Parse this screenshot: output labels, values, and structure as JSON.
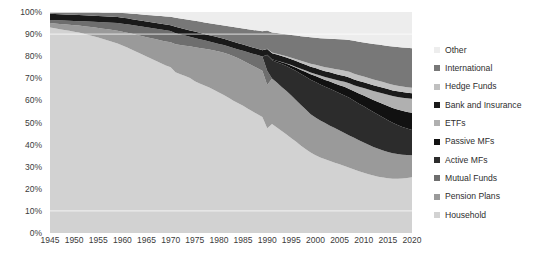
{
  "chart_data": {
    "type": "area",
    "title": "",
    "subtitle": "",
    "xlabel": "",
    "ylabel": "",
    "stacked": true,
    "normalized": true,
    "grid": true,
    "gridlines_visible_at": [
      90,
      10
    ],
    "legend_position": "right",
    "xlim": [
      1945,
      2020
    ],
    "ylim": [
      0,
      100
    ],
    "y_ticks": [
      "0%",
      "10%",
      "20%",
      "30%",
      "40%",
      "50%",
      "60%",
      "70%",
      "80%",
      "90%",
      "100%"
    ],
    "y_tick_values": [
      0,
      10,
      20,
      30,
      40,
      50,
      60,
      70,
      80,
      90,
      100
    ],
    "x_ticks": [
      "1945",
      "1950",
      "1955",
      "1960",
      "1965",
      "1970",
      "1975",
      "1980",
      "1985",
      "1990",
      "1995",
      "2000",
      "2005",
      "2010",
      "2015",
      "2020"
    ],
    "x_tick_values": [
      1945,
      1950,
      1955,
      1960,
      1965,
      1970,
      1975,
      1980,
      1985,
      1990,
      1995,
      2000,
      2005,
      2010,
      2015,
      2020
    ],
    "x": [
      1945,
      1946,
      1947,
      1948,
      1949,
      1950,
      1951,
      1952,
      1953,
      1954,
      1955,
      1956,
      1957,
      1958,
      1959,
      1960,
      1961,
      1962,
      1963,
      1964,
      1965,
      1966,
      1967,
      1968,
      1969,
      1970,
      1971,
      1972,
      1973,
      1974,
      1975,
      1976,
      1977,
      1978,
      1979,
      1980,
      1981,
      1982,
      1983,
      1984,
      1985,
      1986,
      1987,
      1988,
      1989,
      1990,
      1991,
      1992,
      1993,
      1994,
      1995,
      1996,
      1997,
      1998,
      1999,
      2000,
      2001,
      2002,
      2003,
      2004,
      2005,
      2006,
      2007,
      2008,
      2009,
      2010,
      2011,
      2012,
      2013,
      2014,
      2015,
      2016,
      2017,
      2018,
      2019,
      2020
    ],
    "series_order_bottom_to_top": [
      "Household",
      "Pension Plans",
      "Mutual Funds",
      "Active MFs",
      "Passive MFs",
      "ETFs",
      "Bank and Insurance",
      "Hedge Funds",
      "International",
      "Other"
    ],
    "series": [
      {
        "name": "Household",
        "color": "#d2d2d2",
        "values": [
          93.0,
          92.8,
          92.6,
          92.4,
          92.2,
          92.0,
          91.8,
          91.5,
          91.2,
          90.9,
          90.6,
          90.2,
          89.8,
          89.4,
          89.0,
          88.5,
          88.0,
          87.4,
          86.8,
          86.2,
          85.6,
          85.0,
          84.3,
          83.6,
          82.9,
          82.1,
          80.0,
          79.2,
          78.4,
          77.6,
          76.0,
          74.8,
          73.8,
          72.8,
          71.6,
          70.4,
          69.2,
          68.0,
          66.8,
          65.8,
          64.8,
          63.6,
          62.4,
          61.2,
          60.0,
          58.8,
          57.4,
          56.0,
          54.4,
          52.8,
          51.0,
          49.4,
          47.6,
          46.0,
          44.4,
          43.0,
          41.6,
          40.6,
          39.8,
          39.0,
          38.2,
          37.4,
          36.4,
          35.2,
          34.4,
          33.6,
          32.8,
          32.0,
          31.4,
          31.0,
          30.6,
          30.4,
          30.6,
          31.0,
          31.6,
          32.4
        ]
      },
      {
        "name": "Pension Plans",
        "color": "#9a9a9a",
        "values": [
          2.0,
          2.2,
          2.4,
          2.6,
          2.8,
          3.0,
          3.2,
          3.5,
          3.8,
          4.1,
          4.4,
          4.8,
          5.2,
          5.6,
          6.0,
          6.5,
          7.0,
          7.6,
          8.2,
          8.8,
          9.4,
          10.0,
          10.6,
          11.2,
          11.8,
          12.4,
          14.0,
          14.6,
          15.2,
          15.8,
          17.0,
          17.8,
          18.4,
          19.0,
          19.8,
          20.6,
          21.2,
          21.8,
          22.4,
          22.8,
          23.0,
          23.4,
          23.6,
          23.8,
          24.0,
          24.2,
          24.0,
          23.8,
          23.6,
          23.4,
          23.0,
          22.6,
          22.2,
          21.8,
          21.2,
          20.8,
          20.4,
          20.0,
          19.6,
          19.2,
          18.8,
          18.4,
          18.0,
          17.6,
          17.2,
          16.8,
          16.4,
          16.0,
          15.6,
          15.2,
          14.8,
          14.4,
          14.0,
          13.6,
          13.2,
          12.8
        ]
      },
      {
        "name": "Mutual Funds",
        "color": "#6e6e6e",
        "values": [
          1.4,
          1.5,
          1.6,
          1.7,
          1.8,
          1.9,
          2.0,
          2.2,
          2.4,
          2.6,
          2.8,
          3.0,
          3.2,
          3.4,
          3.6,
          3.8,
          4.0,
          4.2,
          4.4,
          4.6,
          4.8,
          5.0,
          5.2,
          5.4,
          5.6,
          5.6,
          5.4,
          5.2,
          5.0,
          4.8,
          4.6,
          4.4,
          4.2,
          4.0,
          3.9,
          3.8,
          3.8,
          3.9,
          4.2,
          4.5,
          5.0,
          5.6,
          6.2,
          6.8,
          7.4,
          8.0,
          0,
          0,
          0,
          0,
          0,
          0,
          0,
          0,
          0,
          0,
          0,
          0,
          0,
          0,
          0,
          0,
          0,
          0,
          0,
          0,
          0,
          0,
          0,
          0,
          0,
          0,
          0,
          0,
          0,
          0
        ]
      },
      {
        "name": "Active MFs",
        "color": "#2c2c2c",
        "values": [
          0,
          0,
          0,
          0,
          0,
          0,
          0,
          0,
          0,
          0,
          0,
          0,
          0,
          0,
          0,
          0,
          0,
          0,
          0,
          0,
          0,
          0,
          0,
          0,
          0,
          0,
          0,
          0,
          0,
          0,
          0,
          0,
          0,
          0,
          0,
          0,
          0,
          0,
          0,
          0,
          0,
          0,
          0,
          0,
          0,
          8.6,
          9.6,
          10.8,
          12.2,
          13.4,
          14.6,
          15.8,
          17.0,
          18.0,
          19.0,
          19.6,
          19.8,
          20.0,
          20.4,
          20.6,
          20.8,
          21.0,
          21.0,
          20.6,
          20.4,
          20.2,
          19.8,
          19.4,
          19.0,
          18.4,
          17.8,
          17.0,
          16.4,
          15.8,
          15.2,
          14.6
        ]
      },
      {
        "name": "Passive MFs",
        "color": "#111111",
        "values": [
          0,
          0,
          0,
          0,
          0,
          0,
          0,
          0,
          0,
          0,
          0,
          0,
          0,
          0,
          0,
          0,
          0,
          0,
          0,
          0,
          0,
          0,
          0,
          0,
          0,
          0,
          0,
          0,
          0,
          0,
          0,
          0,
          0,
          0,
          0,
          0,
          0,
          0,
          0,
          0,
          0,
          0,
          0,
          0,
          0,
          0.4,
          0.6,
          0.8,
          1.0,
          1.2,
          1.5,
          1.8,
          2.2,
          2.6,
          3.0,
          3.3,
          3.5,
          3.7,
          4.0,
          4.2,
          4.5,
          4.8,
          5.0,
          5.2,
          5.6,
          6.0,
          6.4,
          6.8,
          7.2,
          7.6,
          8.0,
          8.4,
          8.8,
          9.2,
          9.6,
          10.0
        ]
      },
      {
        "name": "ETFs",
        "color": "#b0b0b0",
        "values": [
          0,
          0,
          0,
          0,
          0,
          0,
          0,
          0,
          0,
          0,
          0,
          0,
          0,
          0,
          0,
          0,
          0,
          0,
          0,
          0,
          0,
          0,
          0,
          0,
          0,
          0,
          0,
          0,
          0,
          0,
          0,
          0,
          0,
          0,
          0,
          0,
          0,
          0,
          0,
          0,
          0,
          0,
          0,
          0,
          0,
          0.0,
          0.0,
          0.0,
          0.1,
          0.2,
          0.3,
          0.4,
          0.6,
          0.8,
          1.0,
          1.2,
          1.4,
          1.6,
          1.9,
          2.2,
          2.5,
          2.8,
          3.1,
          3.4,
          3.8,
          4.2,
          4.6,
          5.0,
          5.4,
          5.8,
          6.2,
          6.6,
          7.0,
          7.4,
          7.8,
          8.2
        ]
      },
      {
        "name": "Bank and Insurance",
        "color": "#1a1a1a",
        "values": [
          2.8,
          2.8,
          2.8,
          2.8,
          2.8,
          2.8,
          2.8,
          2.8,
          2.8,
          2.8,
          2.8,
          2.8,
          2.8,
          2.8,
          2.8,
          2.8,
          2.8,
          2.8,
          2.8,
          2.8,
          2.8,
          2.8,
          2.8,
          2.8,
          2.8,
          2.8,
          3.2,
          3.2,
          3.2,
          3.2,
          3.2,
          3.2,
          3.2,
          3.2,
          3.2,
          3.2,
          3.2,
          3.2,
          3.2,
          3.2,
          3.2,
          3.2,
          3.2,
          3.2,
          3.2,
          3.2,
          3.2,
          3.2,
          3.2,
          3.2,
          3.2,
          3.2,
          3.2,
          3.2,
          3.2,
          3.2,
          3.2,
          3.2,
          3.2,
          3.2,
          3.2,
          3.2,
          3.2,
          3.2,
          3.2,
          3.2,
          3.2,
          3.2,
          3.2,
          3.2,
          3.2,
          3.2,
          3.2,
          3.2,
          3.2,
          3.2
        ]
      },
      {
        "name": "Hedge Funds",
        "color": "#c0c0c0",
        "values": [
          0,
          0,
          0,
          0,
          0,
          0,
          0,
          0,
          0,
          0,
          0,
          0,
          0,
          0,
          0,
          0,
          0,
          0,
          0,
          0,
          0,
          0,
          0,
          0,
          0,
          0,
          0,
          0,
          0,
          0,
          0,
          0,
          0,
          0,
          0,
          0,
          0,
          0,
          0,
          0,
          0,
          0,
          0,
          0,
          0,
          0.2,
          0.3,
          0.4,
          0.5,
          0.6,
          0.8,
          1.0,
          1.2,
          1.4,
          1.6,
          1.8,
          2.0,
          2.2,
          2.4,
          2.6,
          2.8,
          3.0,
          3.2,
          3.2,
          3.2,
          3.2,
          3.2,
          3.2,
          3.2,
          3.2,
          3.2,
          3.2,
          3.2,
          3.2,
          3.2,
          3.2
        ]
      },
      {
        "name": "International",
        "color": "#787878",
        "values": [
          0.6,
          0.7,
          0.8,
          0.9,
          1.0,
          1.1,
          1.2,
          1.3,
          1.4,
          1.5,
          1.6,
          1.7,
          1.8,
          1.9,
          2.0,
          2.2,
          2.4,
          2.6,
          2.8,
          3.0,
          3.2,
          3.4,
          3.6,
          3.8,
          4.0,
          4.2,
          4.6,
          4.8,
          5.0,
          5.2,
          5.4,
          5.6,
          5.8,
          6.0,
          6.2,
          6.4,
          6.6,
          7.0,
          7.4,
          7.8,
          8.2,
          8.6,
          9.0,
          9.4,
          9.8,
          10.2,
          10.6,
          11.0,
          11.4,
          11.8,
          12.2,
          12.8,
          13.4,
          14.0,
          14.6,
          15.0,
          15.4,
          15.8,
          16.2,
          16.6,
          17.0,
          17.4,
          17.8,
          18.2,
          18.6,
          19.0,
          19.4,
          19.8,
          20.2,
          20.6,
          21.0,
          21.4,
          21.8,
          22.2,
          22.6,
          23.0
        ]
      },
      {
        "name": "Other",
        "color": "#ededed",
        "values": [
          0.2,
          0.2,
          0.2,
          0.2,
          0.2,
          0.2,
          0.2,
          0.2,
          0.2,
          0.2,
          0.2,
          0.3,
          0.3,
          0.3,
          0.4,
          0.5,
          0.6,
          0.8,
          1.0,
          1.2,
          1.4,
          1.6,
          1.8,
          2.0,
          2.2,
          2.4,
          2.8,
          3.2,
          3.6,
          4.0,
          4.4,
          4.8,
          5.2,
          5.6,
          6.0,
          6.4,
          6.8,
          7.2,
          7.6,
          8.0,
          8.4,
          8.8,
          9.2,
          9.6,
          10.0,
          10.4,
          10.8,
          11.2,
          11.6,
          12.0,
          12.4,
          12.8,
          13.2,
          13.6,
          14.0,
          14.2,
          14.4,
          14.6,
          14.8,
          15.0,
          15.2,
          15.4,
          15.6,
          16.0,
          16.6,
          17.0,
          17.4,
          17.8,
          18.2,
          18.6,
          19.0,
          19.4,
          19.8,
          20.2,
          20.6,
          21.0
        ]
      }
    ]
  },
  "legend": {
    "items": [
      {
        "label": "Other",
        "color": "#ededed"
      },
      {
        "label": "International",
        "color": "#787878"
      },
      {
        "label": "Hedge Funds",
        "color": "#c0c0c0"
      },
      {
        "label": "Bank and Insurance",
        "color": "#1a1a1a"
      },
      {
        "label": "ETFs",
        "color": "#b0b0b0"
      },
      {
        "label": "Passive MFs",
        "color": "#111111"
      },
      {
        "label": "Active MFs",
        "color": "#2c2c2c"
      },
      {
        "label": "Mutual Funds",
        "color": "#6e6e6e"
      },
      {
        "label": "Pension Plans",
        "color": "#9a9a9a"
      },
      {
        "label": "Household",
        "color": "#d2d2d2"
      }
    ]
  },
  "colors": {
    "axis_text": "#3b3b3b",
    "legend_text": "#2e2e2e",
    "background": "#ffffff",
    "gridline": "#f2f2f2"
  }
}
